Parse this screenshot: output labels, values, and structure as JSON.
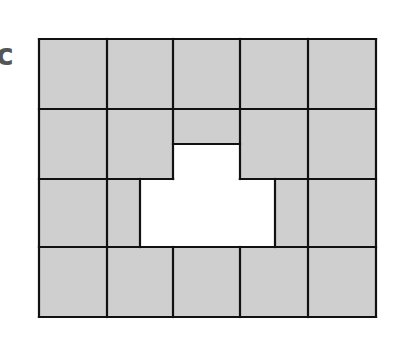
{
  "figure": {
    "label": "c",
    "colors": {
      "fill": "#cfcfcf",
      "line": "#111111",
      "hole": "#ffffff",
      "label": "#555555"
    },
    "grid": {
      "columns_x": [
        39,
        107,
        173,
        240,
        308,
        376
      ],
      "rows_y": [
        39,
        109,
        179,
        247,
        317
      ],
      "column_count": 5,
      "row_count": 4
    },
    "cutout": {
      "upper_notch": {
        "x1": 173,
        "y1": 144,
        "x2": 240,
        "y2": 179
      },
      "lower_block": {
        "x1": 140,
        "y1": 179,
        "x2": 275,
        "y2": 247
      }
    }
  }
}
